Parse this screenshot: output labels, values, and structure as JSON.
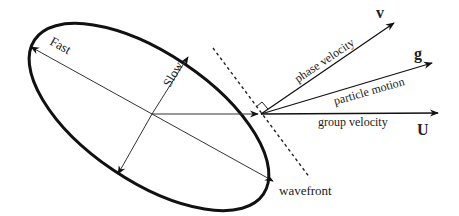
{
  "diagram": {
    "labels": {
      "fast": "Fast",
      "slow": "Slow",
      "phase_velocity": "phase velocity",
      "particle_motion": "particle motion",
      "group_velocity": "group velocity",
      "wavefront": "wavefront",
      "v": "v",
      "g": "g",
      "U": "U"
    },
    "colors": {
      "stroke": "#111111",
      "background": "#ffffff"
    }
  }
}
